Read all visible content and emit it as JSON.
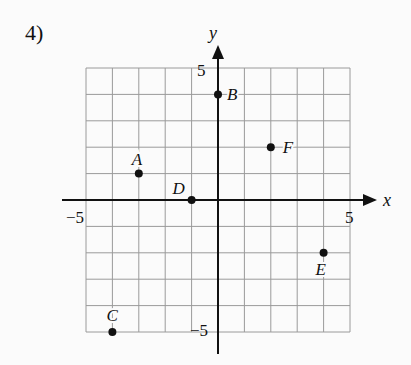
{
  "problem": {
    "number": "4)"
  },
  "chart_data": {
    "type": "scatter",
    "title": "",
    "xlabel": "x",
    "ylabel": "y",
    "xlim": [
      -5,
      5
    ],
    "ylim": [
      -5,
      5
    ],
    "grid": true,
    "tick_labels": {
      "x_min": "−5",
      "x_max": "5",
      "y_min": "−5",
      "y_max": "5"
    },
    "points": [
      {
        "label": "A",
        "x": -3,
        "y": 1
      },
      {
        "label": "B",
        "x": 0,
        "y": 4
      },
      {
        "label": "C",
        "x": -4,
        "y": -5
      },
      {
        "label": "D",
        "x": -1,
        "y": 0
      },
      {
        "label": "E",
        "x": 4,
        "y": -2
      },
      {
        "label": "F",
        "x": 2,
        "y": 2
      }
    ]
  },
  "colors": {
    "grid": "#9a9a9a",
    "axis": "#111111",
    "point": "#111111",
    "background": "#fbfbfb"
  }
}
